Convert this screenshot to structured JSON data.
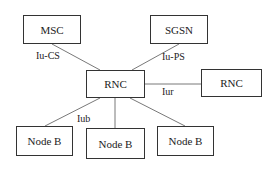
{
  "nodes": {
    "msc": {
      "label": "MSC"
    },
    "sgsn": {
      "label": "SGSN"
    },
    "rnc_main": {
      "label": "RNC"
    },
    "rnc_peer": {
      "label": "RNC"
    },
    "nodeb_1": {
      "label": "Node B"
    },
    "nodeb_2": {
      "label": "Node B"
    },
    "nodeb_3": {
      "label": "Node B"
    }
  },
  "interfaces": {
    "iu_cs": "Iu-CS",
    "iu_ps": "Iu-PS",
    "iur": "Iur",
    "iub": "Iub"
  },
  "colors": {
    "line": "#555555",
    "box_border": "#333333",
    "text": "#222222"
  }
}
